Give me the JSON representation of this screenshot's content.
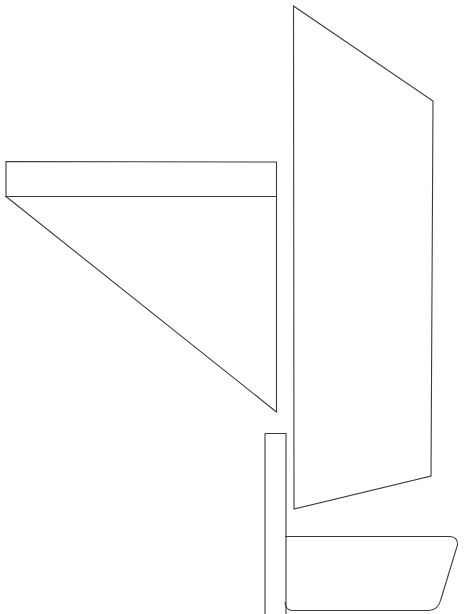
{
  "figure": {
    "canvas": {
      "width": 469,
      "height": 614,
      "background_color": "#ffffff"
    },
    "style": {
      "stroke_color": "#3a3a3a",
      "stroke_width": 1.1,
      "fill": "none"
    },
    "shapes": [
      {
        "name": "mainsail",
        "type": "polygon",
        "closed": true,
        "points": [
          [
            293.5,
            6
          ],
          [
            433,
            101
          ],
          [
            431,
            476
          ],
          [
            294,
            509
          ]
        ]
      },
      {
        "name": "boom-bar",
        "type": "polygon",
        "closed": true,
        "points": [
          [
            6,
            161.5
          ],
          [
            276.5,
            162
          ],
          [
            276.5,
            196.5
          ],
          [
            6,
            196.5
          ]
        ]
      },
      {
        "name": "jib-sail",
        "type": "polygon",
        "closed": true,
        "points": [
          [
            6,
            196.5
          ],
          [
            276.5,
            196.5
          ],
          [
            276.5,
            412
          ]
        ]
      },
      {
        "name": "mast-spar",
        "type": "polyline",
        "closed": false,
        "points": [
          [
            265,
            433.5
          ],
          [
            286,
            433.5
          ],
          [
            286,
            614
          ]
        ]
      },
      {
        "name": "mast-spar-left",
        "type": "polyline",
        "closed": false,
        "points": [
          [
            265,
            433.5
          ],
          [
            265,
            614
          ]
        ]
      },
      {
        "name": "hull",
        "type": "path",
        "path": "M 285 536.5 L 450 536.5 Q 458 536.8 457.5 545 L 441 599 Q 438.5 609.8 429 610.5 L 292 610.5 Q 285.5 610 285 602"
      }
    ],
    "part_labels": {
      "mainsail": "mainsail",
      "jib": "jib",
      "boom": "boom",
      "mast": "mast",
      "hull": "hull"
    }
  }
}
